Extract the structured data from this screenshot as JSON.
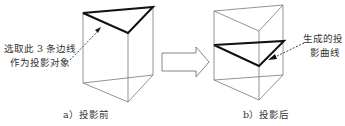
{
  "diagram": {
    "left_panel": {
      "annotation_line1": "选取此 3 条边线",
      "annotation_line2": "作为投影对象",
      "caption": "a）投影前"
    },
    "right_panel": {
      "annotation_line1": "生成的投",
      "annotation_line2": "影曲线",
      "caption": "b）投影后"
    },
    "colors": {
      "thin_edge": "#555555",
      "bold_edge": "#111111",
      "text": "#333333"
    }
  }
}
